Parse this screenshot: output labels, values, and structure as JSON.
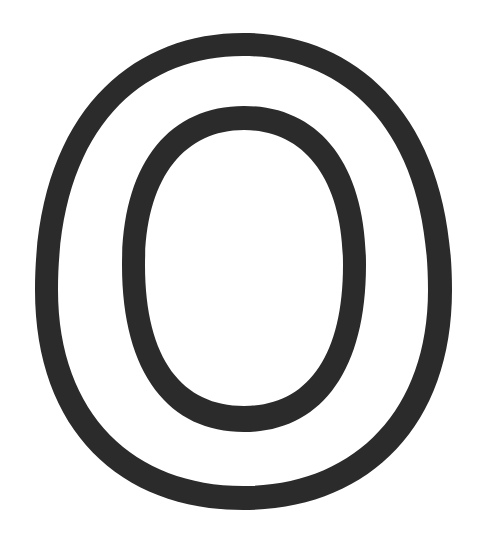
{
  "figure": {
    "glyph": "O",
    "style": "outline",
    "colors": {
      "stroke": "#2b2b2b",
      "background": "#ffffff"
    }
  }
}
